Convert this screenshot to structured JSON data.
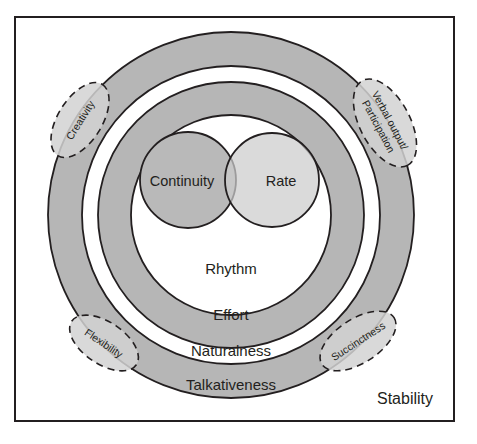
{
  "diagram": {
    "frame": {
      "border_color": "#231f20"
    },
    "colors": {
      "ring_gray": "#b6b6b6",
      "ring_white": "#ffffff",
      "core_left_gray": "#b9b9b9",
      "core_right_gray": "#cccccc",
      "bubble_fill": "#d2d2d2",
      "stroke": "#231f20",
      "text": "#231f20"
    },
    "rings": [
      {
        "name": "outer-ring",
        "label": "Talkativeness",
        "fill": "#b6b6b6",
        "outer_radius": 183,
        "inner_radius": 149
      },
      {
        "name": "second-ring",
        "label": "Naturalness",
        "fill": "#ffffff",
        "outer_radius": 149,
        "inner_radius": 133
      },
      {
        "name": "third-ring",
        "label": "Effort",
        "fill": "#b6b6b6",
        "outer_radius": 133,
        "inner_radius": 100
      },
      {
        "name": "inner-disc",
        "label": "Rhythm",
        "fill": "#ffffff",
        "outer_radius": 100,
        "inner_radius": 0
      }
    ],
    "core_circles": [
      {
        "name": "continuity-circle",
        "label": "Continuity",
        "fill": "#b9b9b9",
        "cx": 188,
        "cy": 180,
        "r": 48
      },
      {
        "name": "rate-circle",
        "label": "Rate",
        "fill": "#cccccc",
        "cx": 272,
        "cy": 180,
        "r": 47
      }
    ],
    "bubbles": [
      {
        "name": "creativity-bubble",
        "lines": [
          "Creativity"
        ],
        "cx": 80,
        "cy": 120,
        "rx": 42,
        "ry": 22,
        "rotation": -58
      },
      {
        "name": "verbal-output-bubble",
        "lines": [
          "Verbal output/",
          "Participation"
        ],
        "cx": 385,
        "cy": 123,
        "rx": 48,
        "ry": 25,
        "rotation": 62
      },
      {
        "name": "flexibility-bubble",
        "lines": [
          "Flexibility"
        ],
        "cx": 104,
        "cy": 343,
        "rx": 39,
        "ry": 21,
        "rotation": 34
      },
      {
        "name": "succinctness-bubble",
        "lines": [
          "Succinctness"
        ],
        "cx": 358,
        "cy": 341,
        "rx": 43,
        "ry": 22,
        "rotation": -33
      }
    ],
    "corner_label": {
      "name": "stability-label",
      "text": "Stability",
      "x": 405,
      "y": 404
    }
  }
}
